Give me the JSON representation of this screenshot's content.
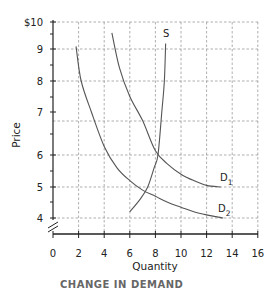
{
  "chart_data": {
    "type": "line",
    "title": "",
    "xlabel": "Quantity",
    "ylabel": "Price",
    "xlim": [
      0,
      16
    ],
    "ylim": [
      4,
      10
    ],
    "y_axis_break": true,
    "grid": true,
    "x_ticks": [
      0,
      2,
      4,
      6,
      8,
      10,
      12,
      14,
      16
    ],
    "y_ticks": [
      "4",
      "5",
      "6",
      "7",
      "8",
      "9",
      "$10"
    ],
    "series": [
      {
        "name": "S",
        "label": "S",
        "points": [
          [
            6.0,
            4.2
          ],
          [
            6.8,
            4.6
          ],
          [
            7.4,
            5.0
          ],
          [
            7.9,
            5.6
          ],
          [
            8.2,
            6.0
          ],
          [
            8.5,
            7.0
          ],
          [
            8.7,
            8.0
          ],
          [
            8.8,
            9.2
          ]
        ]
      },
      {
        "name": "D1",
        "label": "D",
        "subscript": "1",
        "points": [
          [
            4.6,
            9.6
          ],
          [
            5.2,
            8.4
          ],
          [
            6.0,
            7.5
          ],
          [
            7.0,
            6.8
          ],
          [
            8.0,
            6.1
          ],
          [
            9.0,
            5.7
          ],
          [
            10.0,
            5.4
          ],
          [
            11.0,
            5.2
          ],
          [
            12.0,
            5.05
          ],
          [
            13.1,
            5.0
          ]
        ]
      },
      {
        "name": "D2",
        "label": "D",
        "subscript": "2",
        "points": [
          [
            1.8,
            9.1
          ],
          [
            2.2,
            8.0
          ],
          [
            3.0,
            7.0
          ],
          [
            4.0,
            6.2
          ],
          [
            5.0,
            5.6
          ],
          [
            6.0,
            5.2
          ],
          [
            7.0,
            4.9
          ],
          [
            8.0,
            4.7
          ],
          [
            9.0,
            4.5
          ],
          [
            10.0,
            4.35
          ],
          [
            11.0,
            4.2
          ],
          [
            12.0,
            4.1
          ],
          [
            13.3,
            4.0
          ]
        ]
      }
    ]
  },
  "caption": "CHANGE IN DEMAND"
}
